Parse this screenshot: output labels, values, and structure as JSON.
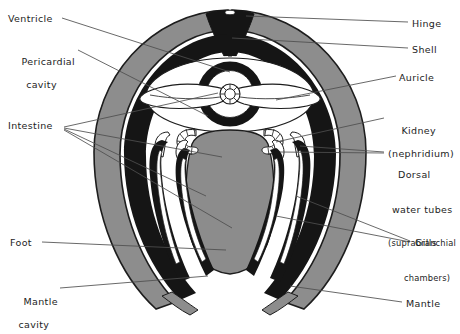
{
  "figure": {
    "colors": {
      "background": "#ffffff",
      "shell_gray": "#8d8d8d",
      "mantle_black": "#151515",
      "foot_gray": "#8c8c8c",
      "outline": "#1d1d1d",
      "leader_line": "#5a5a5a",
      "text": "#1d1d1d",
      "white_cavity": "#ffffff"
    },
    "labels": [
      {
        "id": "ventricle",
        "text": "Ventricle",
        "side": "left",
        "x": 8,
        "y": 13
      },
      {
        "id": "pericardial",
        "text": "Pericardial",
        "sub": "cavity",
        "side": "left",
        "x": 8,
        "y": 44
      },
      {
        "id": "intestine",
        "text": "Intestine",
        "side": "left",
        "x": 8,
        "y": 120
      },
      {
        "id": "foot",
        "text": "Foot",
        "side": "left",
        "x": 10,
        "y": 237
      },
      {
        "id": "mantle-cavity",
        "text": "Mantle",
        "sub": "cavity",
        "side": "left",
        "x": 10,
        "y": 284
      },
      {
        "id": "hinge",
        "text": "Hinge",
        "side": "right",
        "x": 412,
        "y": 18
      },
      {
        "id": "shell",
        "text": "Shell",
        "side": "right",
        "x": 412,
        "y": 44
      },
      {
        "id": "auricle",
        "text": "Auricle",
        "side": "right",
        "x": 399,
        "y": 72
      },
      {
        "id": "kidney",
        "text": "Kidney",
        "sub": "(nephridium)",
        "side": "right",
        "x": 388,
        "y": 113
      },
      {
        "id": "dorsal-water-tubes",
        "text": "Dorsal",
        "sub2": [
          "water tubes",
          "(suprabranchial",
          "chambers)"
        ],
        "side": "right",
        "x": 388,
        "y": 146
      },
      {
        "id": "gills",
        "text": "Gills",
        "side": "right",
        "x": 415,
        "y": 237
      },
      {
        "id": "mantle",
        "text": "Mantle",
        "side": "right",
        "x": 406,
        "y": 298
      }
    ],
    "structures": [
      "shell",
      "hinge",
      "mantle",
      "mantle-cavity",
      "ventricle",
      "pericardial-cavity",
      "auricle",
      "intestine",
      "kidney",
      "dorsal-water-tubes",
      "gills",
      "foot"
    ]
  }
}
